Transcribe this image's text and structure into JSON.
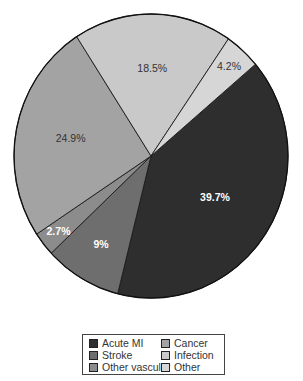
{
  "chart_data": {
    "type": "pie",
    "title": "",
    "caption": "189 deaths in 1052 patients",
    "start_angle_deg": 49.7,
    "direction": "clockwise",
    "slices": [
      {
        "label": "Acute MI",
        "value": 39.7,
        "display": "39.7%",
        "color": "#2e2e2e",
        "text_color": "#ffffff",
        "bold": true
      },
      {
        "label": "Stroke",
        "value": 9,
        "display": "9%",
        "color": "#6e6e6e",
        "text_color": "#ffffff",
        "bold": true
      },
      {
        "label": "Other vascular",
        "value": 2.7,
        "display": "2.7%",
        "color": "#8c8c8c",
        "text_color": "#ffffff",
        "bold": true
      },
      {
        "label": "Cancer",
        "value": 24.9,
        "display": "24.9%",
        "color": "#a3a3a3",
        "text_color": "#333333",
        "bold": false
      },
      {
        "label": "Infection",
        "value": 18.5,
        "display": "18.5%",
        "color": "#c9c9c9",
        "text_color": "#333333",
        "bold": false
      },
      {
        "label": "Other",
        "value": 4.2,
        "display": "4.2%",
        "color": "#d6d6d6",
        "text_color": "#333333",
        "bold": false
      }
    ],
    "legend": {
      "position": "bottom",
      "columns": 2,
      "entries": [
        "Acute MI",
        "Cancer",
        "Stroke",
        "Infection",
        "Other vascular",
        "Other"
      ]
    }
  },
  "caption": "189 deaths in 1052 patients",
  "legend": [
    {
      "label": "Acute MI",
      "color": "#2e2e2e"
    },
    {
      "label": "Cancer",
      "color": "#a3a3a3"
    },
    {
      "label": "Stroke",
      "color": "#6e6e6e"
    },
    {
      "label": "Infection",
      "color": "#c9c9c9"
    },
    {
      "label": "Other vascular",
      "color": "#8c8c8c"
    },
    {
      "label": "Other",
      "color": "#d6d6d6"
    }
  ]
}
